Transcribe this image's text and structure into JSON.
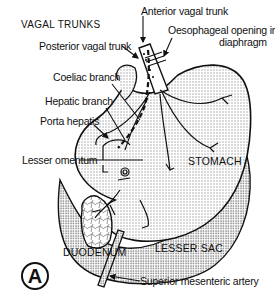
{
  "figure": {
    "title": "VAGAL TRUNKS",
    "panel_label": "A"
  },
  "labels": {
    "posterior_vagal_trunk": "Posterior vagal trunk",
    "anterior_vagal_trunk": "Anterior vagal trunk",
    "oesophageal_opening_line1": "Oesophageal opening in",
    "oesophageal_opening_line2": "diaphragm",
    "coeliac_branch": "Coeliac branch",
    "hepatic_branch": "Hepatic branch",
    "porta_hepatis": "Porta hepatis",
    "lesser_omentum": "Lesser omentum",
    "stomach": "STOMACH",
    "duodenum": "DUODENUM",
    "lesser_sac": "LESSER SAC",
    "superior_mesenteric_artery": "Superior mesenteric artery"
  },
  "colors": {
    "ink": "#111111",
    "stipple": "#d9d9d9",
    "background": "#ffffff"
  }
}
